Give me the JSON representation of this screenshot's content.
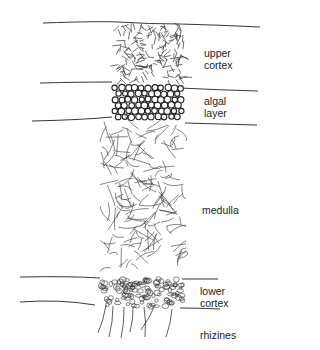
{
  "diagram": {
    "colors": {
      "ink": "#222222",
      "background": "#ffffff"
    },
    "layers": [
      {
        "id": "upper-cortex",
        "label_line1": "upper",
        "label_line2": "cortex"
      },
      {
        "id": "algal-layer",
        "label_line1": "algal",
        "label_line2": "layer"
      },
      {
        "id": "medulla",
        "label_line1": "medulla"
      },
      {
        "id": "lower-cortex",
        "label_line1": "lower",
        "label_line2": "cortex"
      },
      {
        "id": "rhizines",
        "label_line1": "rhizines"
      }
    ]
  }
}
